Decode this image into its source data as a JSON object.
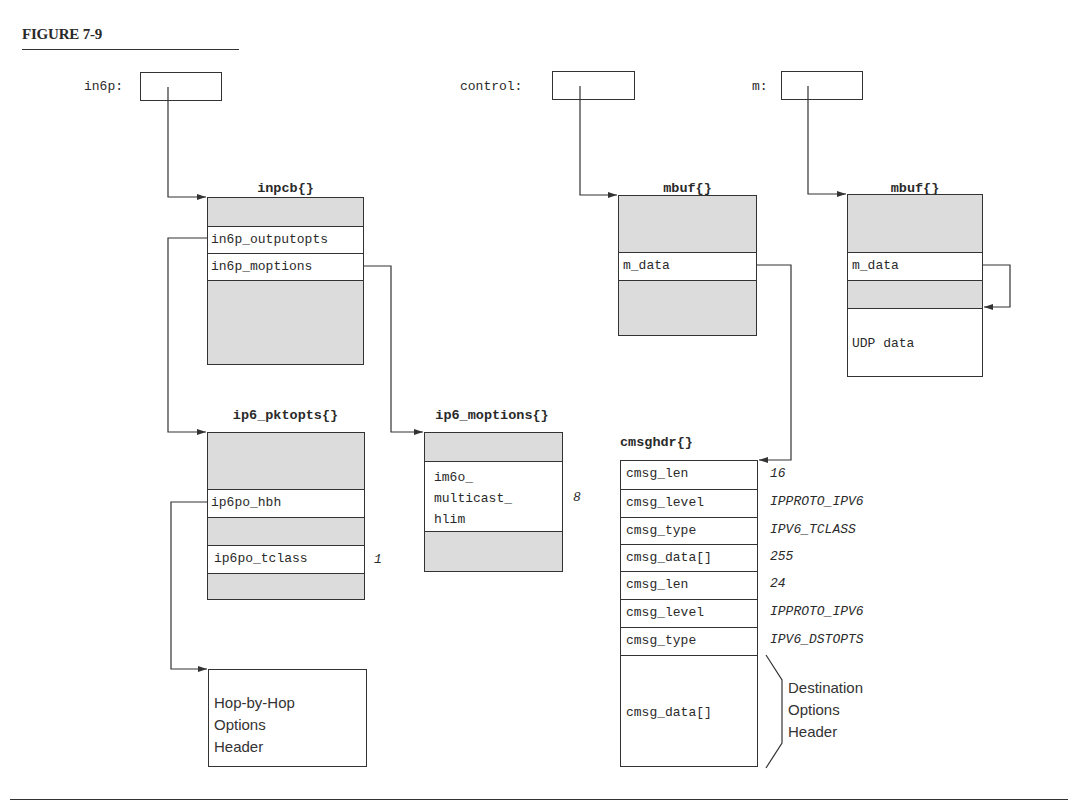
{
  "figure": {
    "title": "FIGURE 7-9"
  },
  "pointers": {
    "in6p": "in6p:",
    "control": "control:",
    "m": "m:"
  },
  "structs": {
    "inpcb": {
      "title": "inpcb{}",
      "fields": [
        "in6p_outputopts",
        "in6p_moptions"
      ]
    },
    "ip6_pktopts": {
      "title": "ip6_pktopts{}",
      "fields": [
        "ip6po_hbh",
        "ip6po_tclass"
      ],
      "values": {
        "ip6po_tclass": "1"
      }
    },
    "ip6_moptions": {
      "title": "ip6_moptions{}",
      "fields": [
        "im6o_\nmulticast_\nhlim"
      ],
      "values": {
        "im6o_multicast_hlim": "8"
      }
    },
    "mbuf_control": {
      "title": "mbuf{}",
      "fields": [
        "m_data"
      ]
    },
    "mbuf_m": {
      "title": "mbuf{}",
      "fields": [
        "m_data",
        "UDP data"
      ]
    },
    "cmsghdr": {
      "title": "cmsghdr{}",
      "rows": [
        {
          "field": "cmsg_len",
          "value": "16"
        },
        {
          "field": "cmsg_level",
          "value": "IPPROTO_IPV6"
        },
        {
          "field": "cmsg_type",
          "value": "IPV6_TCLASS"
        },
        {
          "field": "cmsg_data[]",
          "value": "255"
        },
        {
          "field": "cmsg_len",
          "value": "24"
        },
        {
          "field": "cmsg_level",
          "value": "IPPROTO_IPV6"
        },
        {
          "field": "cmsg_type",
          "value": "IPV6_DSTOPTS"
        },
        {
          "field": "cmsg_data[]",
          "value": ""
        }
      ]
    }
  },
  "annotations": {
    "hop_by_hop": "Hop-by-Hop\nOptions\nHeader",
    "destination_options": "Destination\nOptions\nHeader"
  },
  "colors": {
    "line": "#333333",
    "gray_fill": "#dcdcdc",
    "background": "#ffffff"
  }
}
